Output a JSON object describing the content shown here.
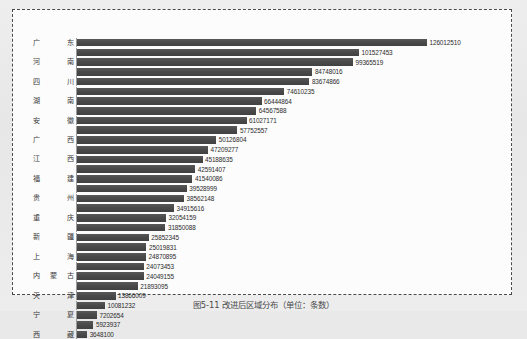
{
  "figure": {
    "caption": "图5-11 改进后区域分布（单位：条数）",
    "frame_style": "dashed"
  },
  "colors": {
    "bar": "#4d4d4d",
    "axis": "#9a9a9a",
    "label_text": "#3a3a3a",
    "value_text": "#2b2b2b",
    "frame_border": "#4a4a4a",
    "plot_background": "#fcfcfc",
    "page_background": "#e9e9e9"
  },
  "chart_data": {
    "type": "bar",
    "orientation": "horizontal",
    "title": "",
    "subtitle": "",
    "xlabel": "",
    "ylabel": "",
    "grid": false,
    "legend": false,
    "value_labels": true,
    "sorted": "descending",
    "xlim": [
      0,
      126012510
    ],
    "categories": [
      "广东",
      "河南",
      "四川",
      "湖南",
      "安徽",
      "广西",
      "江西",
      "福建",
      "贵州",
      "重庆",
      "新疆",
      "上海",
      "内蒙古",
      "天津",
      "宁夏",
      "西藏"
    ],
    "bars": [
      {
        "label": "广东",
        "value": 126012510,
        "value_text": "126012510"
      },
      {
        "label": "",
        "value": 101527453,
        "value_text": "101527453"
      },
      {
        "label": "河南",
        "value": 99365519,
        "value_text": "99365519"
      },
      {
        "label": "",
        "value": 84748016,
        "value_text": "84748016"
      },
      {
        "label": "四川",
        "value": 83674866,
        "value_text": "83674866"
      },
      {
        "label": "",
        "value": 74610235,
        "value_text": "74610235"
      },
      {
        "label": "湖南",
        "value": 66444864,
        "value_text": "66444864"
      },
      {
        "label": "",
        "value": 64567588,
        "value_text": "64567588"
      },
      {
        "label": "安徽",
        "value": 61027171,
        "value_text": "61027171"
      },
      {
        "label": "",
        "value": 57752557,
        "value_text": "57752557"
      },
      {
        "label": "广西",
        "value": 50126804,
        "value_text": "50126804"
      },
      {
        "label": "",
        "value": 47209277,
        "value_text": "47209277"
      },
      {
        "label": "江西",
        "value": 45188635,
        "value_text": "45188635"
      },
      {
        "label": "",
        "value": 42591407,
        "value_text": "42591407"
      },
      {
        "label": "福建",
        "value": 41540086,
        "value_text": "41540086"
      },
      {
        "label": "",
        "value": 39528999,
        "value_text": "39528999"
      },
      {
        "label": "贵州",
        "value": 38562148,
        "value_text": "38562148"
      },
      {
        "label": "",
        "value": 34915616,
        "value_text": "34915616"
      },
      {
        "label": "重庆",
        "value": 32054159,
        "value_text": "32054159"
      },
      {
        "label": "",
        "value": 31850088,
        "value_text": "31850088"
      },
      {
        "label": "新疆",
        "value": 25852345,
        "value_text": "25852345"
      },
      {
        "label": "",
        "value": 25019831,
        "value_text": "25019831"
      },
      {
        "label": "上海",
        "value": 24870895,
        "value_text": "24870895"
      },
      {
        "label": "",
        "value": 24073453,
        "value_text": "24073453"
      },
      {
        "label": "内蒙古",
        "value": 24049155,
        "value_text": "24049155"
      },
      {
        "label": "",
        "value": 21893095,
        "value_text": "21893095"
      },
      {
        "label": "天津",
        "value": 13866009,
        "value_text": "13866009"
      },
      {
        "label": "",
        "value": 10081232,
        "value_text": "10081232"
      },
      {
        "label": "宁夏",
        "value": 7202654,
        "value_text": "7202654"
      },
      {
        "label": "",
        "value": 5923937,
        "value_text": "5923937"
      },
      {
        "label": "西藏",
        "value": 3648100,
        "value_text": "3648100"
      }
    ]
  }
}
